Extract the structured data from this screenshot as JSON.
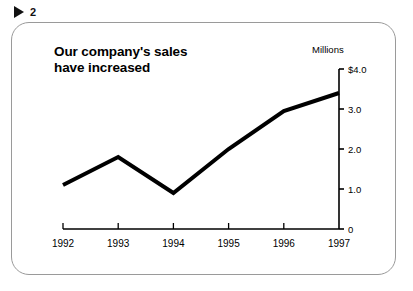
{
  "figure_marker": {
    "icon": "play-triangle-icon",
    "number": "2"
  },
  "chart_data": {
    "type": "line",
    "title": "Our company's sales\nhave increased",
    "xlabel": "",
    "ylabel": "Millions",
    "categories": [
      "1992",
      "1993",
      "1994",
      "1995",
      "1996",
      "1997"
    ],
    "values": [
      1.1,
      1.8,
      0.9,
      2.0,
      2.95,
      3.4
    ],
    "series": [
      {
        "name": "Sales",
        "values": [
          1.1,
          1.8,
          0.9,
          2.0,
          2.95,
          3.4
        ]
      }
    ],
    "ylim": [
      0,
      4.0
    ],
    "ytick_values": [
      0,
      1.0,
      2.0,
      3.0,
      4.0
    ],
    "ytick_labels": [
      "0",
      "1.0",
      "2.0",
      "3.0",
      "$4.0"
    ],
    "xtick_labels": [
      "1992",
      "1993",
      "1994",
      "1995",
      "1996",
      "1997"
    ],
    "axis_position": "right",
    "grid": false,
    "legend": false,
    "line_color": "#000000",
    "line_width": 4
  },
  "colors": {
    "line": "#000000",
    "axis": "#000000",
    "frame_border": "#9a9a9a",
    "background": "#ffffff",
    "text": "#000000"
  }
}
